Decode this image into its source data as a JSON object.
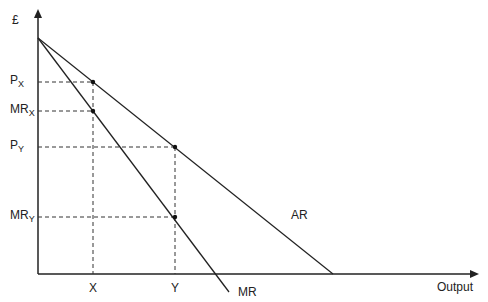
{
  "diagram": {
    "y_axis_label": "£",
    "x_axis_label": "Output",
    "curves": [
      {
        "name": "AR",
        "label": "AR"
      },
      {
        "name": "MR",
        "label": "MR"
      }
    ],
    "y_levels": [
      {
        "main": "P",
        "sub": "X"
      },
      {
        "main": "MR",
        "sub": "X"
      },
      {
        "main": "P",
        "sub": "Y"
      },
      {
        "main": "MR",
        "sub": "Y"
      }
    ],
    "x_levels": [
      "X",
      "Y"
    ]
  }
}
